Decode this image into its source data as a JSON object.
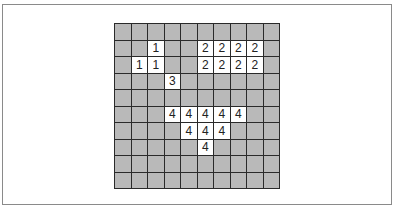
{
  "figure": {
    "type": "grid-labeling",
    "rows": 10,
    "cols": 10,
    "colors": {
      "empty_cell": "#b9b9b9",
      "labeled_cell": "#ffffff",
      "grid_line": "#2a2a2a",
      "frame_border": "#8a8a8a"
    },
    "cells": [
      [
        "",
        "",
        "",
        "",
        "",
        "",
        "",
        "",
        "",
        ""
      ],
      [
        "",
        "",
        "1",
        "",
        "",
        "2",
        "2",
        "2",
        "2",
        ""
      ],
      [
        "",
        "1",
        "1",
        "",
        "",
        "2",
        "2",
        "2",
        "2",
        ""
      ],
      [
        "",
        "",
        "",
        "3",
        "",
        "",
        "",
        "",
        "",
        ""
      ],
      [
        "",
        "",
        "",
        "",
        "",
        "",
        "",
        "",
        "",
        ""
      ],
      [
        "",
        "",
        "",
        "4",
        "4",
        "4",
        "4",
        "4",
        "",
        ""
      ],
      [
        "",
        "",
        "",
        "",
        "4",
        "4",
        "4",
        "",
        "",
        ""
      ],
      [
        "",
        "",
        "",
        "",
        "",
        "4",
        "",
        "",
        "",
        ""
      ],
      [
        "",
        "",
        "",
        "",
        "",
        "",
        "",
        "",
        "",
        ""
      ],
      [
        "",
        "",
        "",
        "",
        "",
        "",
        "",
        "",
        "",
        ""
      ]
    ]
  }
}
